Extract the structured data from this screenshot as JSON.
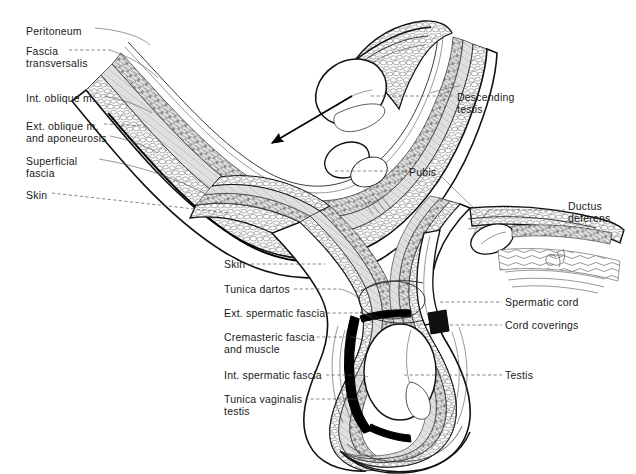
{
  "figure": {
    "background_color": "#ffffff",
    "ink_color": "#1a1a1a",
    "leader_color": "#555555",
    "signature": "artist-signature"
  },
  "labels_left_upper": [
    {
      "id": "peritoneum",
      "lines": [
        "Peritoneum"
      ],
      "x": 26,
      "y": 25
    },
    {
      "id": "fascia-transversalis",
      "lines": [
        "Fascia",
        "transversalis"
      ],
      "x": 26,
      "y": 45
    },
    {
      "id": "int-oblique",
      "lines": [
        "Int. oblique m."
      ],
      "x": 26,
      "y": 92
    },
    {
      "id": "ext-oblique",
      "lines": [
        "Ext. oblique m.",
        "and aponeurosis"
      ],
      "x": 26,
      "y": 120
    },
    {
      "id": "superficial-fascia",
      "lines": [
        "Superficial",
        "fascia"
      ],
      "x": 26,
      "y": 155
    },
    {
      "id": "skin-upper",
      "lines": [
        "Skin"
      ],
      "x": 26,
      "y": 189
    }
  ],
  "labels_right_upper": [
    {
      "id": "descending-testis",
      "lines": [
        "Descending",
        "testis"
      ],
      "x": 457,
      "y": 91
    },
    {
      "id": "pubis",
      "lines": [
        "Pubis"
      ],
      "x": 409,
      "y": 166
    },
    {
      "id": "ductus-deferens",
      "lines": [
        "Ductus",
        "deferens"
      ],
      "x": 568,
      "y": 200
    }
  ],
  "labels_left_lower": [
    {
      "id": "skin-lower",
      "lines": [
        "Skin"
      ],
      "x": 224,
      "y": 260
    },
    {
      "id": "tunica-dartos",
      "lines": [
        "Tunica dartos"
      ],
      "x": 224,
      "y": 285
    },
    {
      "id": "ext-spermatic-fascia",
      "lines": [
        "Ext. spermatic fascia"
      ],
      "x": 224,
      "y": 309
    },
    {
      "id": "cremasteric-fascia",
      "lines": [
        "Cremasteric fascia",
        "and muscle"
      ],
      "x": 224,
      "y": 333
    },
    {
      "id": "int-spermatic-fascia",
      "lines": [
        "Int. spermatic fascia"
      ],
      "x": 224,
      "y": 371
    },
    {
      "id": "tunica-vaginalis",
      "lines": [
        "Tunica vaginalis",
        "testis"
      ],
      "x": 224,
      "y": 395
    }
  ],
  "labels_right_lower": [
    {
      "id": "spermatic-cord",
      "lines": [
        "Spermatic cord"
      ],
      "x": 505,
      "y": 298
    },
    {
      "id": "cord-coverings",
      "lines": [
        "Cord coverings"
      ],
      "x": 505,
      "y": 321
    },
    {
      "id": "testis",
      "lines": [
        "Testis"
      ],
      "x": 505,
      "y": 371
    }
  ],
  "annotations": {
    "descent_arrow": "arrow-indicating-direction-of-testicular-descent"
  }
}
